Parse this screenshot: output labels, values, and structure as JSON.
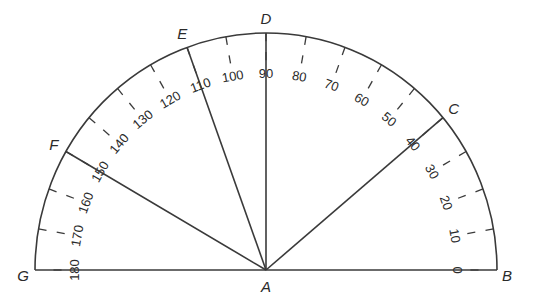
{
  "diagram": {
    "type": "protractor",
    "center_label": "A",
    "scale": {
      "start": 0,
      "end": 180,
      "step": 10,
      "labels": [
        "0",
        "10",
        "20",
        "30",
        "40",
        "50",
        "60",
        "70",
        "80",
        "90",
        "100",
        "110",
        "120",
        "130",
        "140",
        "150",
        "160",
        "170",
        "180"
      ]
    },
    "points": [
      {
        "label": "B",
        "angle": 0
      },
      {
        "label": "C",
        "angle": 40
      },
      {
        "label": "D",
        "angle": 90
      },
      {
        "label": "E",
        "angle": 110
      },
      {
        "label": "F",
        "angle": 150
      },
      {
        "label": "G",
        "angle": 180
      }
    ],
    "rays": [
      {
        "from": "A",
        "to": "C"
      },
      {
        "from": "A",
        "to": "D"
      },
      {
        "from": "A",
        "to": "E"
      },
      {
        "from": "A",
        "to": "F"
      }
    ],
    "baseline": {
      "from": "G",
      "to": "B"
    },
    "colors": {
      "stroke": "#3a3a3a",
      "text": "#2a2a2a",
      "background": "#ffffff"
    }
  }
}
